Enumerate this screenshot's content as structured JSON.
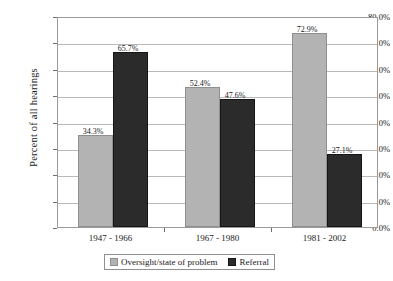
{
  "chart_data": {
    "type": "bar",
    "title": "",
    "xlabel": "",
    "ylabel": "Percent of all hearings",
    "categories": [
      "1947 - 1966",
      "1967 - 1980",
      "1981 - 2002"
    ],
    "series": [
      {
        "name": "Oversight/state of problem",
        "color": "#b3b3b3",
        "values": [
          34.3,
          52.4,
          72.9
        ],
        "labels": [
          "34.3%",
          "52.4%",
          "72.9%"
        ]
      },
      {
        "name": "Referral",
        "color": "#2b2b2b",
        "values": [
          65.7,
          47.6,
          27.1
        ],
        "labels": [
          "65.7%",
          "47.6%",
          "27.1%"
        ]
      }
    ],
    "ylim": [
      0,
      80
    ],
    "ytick_values": [
      0,
      10,
      20,
      30,
      40,
      50,
      60,
      70,
      80
    ],
    "ytick_labels": [
      "0.0%",
      "10.0%",
      "20.0%",
      "30.0%",
      "40.0%",
      "50.0%",
      "60.0%",
      "70.0%",
      "80.0%"
    ],
    "grid": "horizontal",
    "legend_position": "bottom"
  },
  "legend": {
    "items": [
      {
        "label": "Oversight/state of problem"
      },
      {
        "label": "Referral"
      }
    ]
  }
}
